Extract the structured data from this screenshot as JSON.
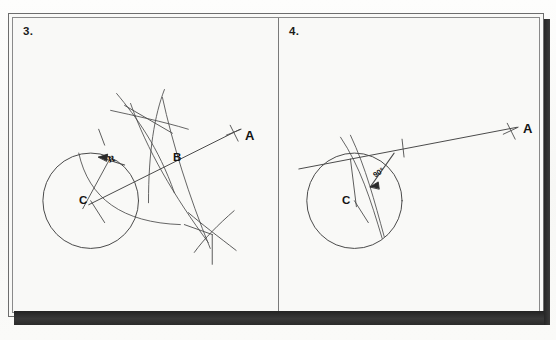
{
  "page": {
    "caption_above": "the circle.",
    "background_color": "#fbfbfa",
    "ink_color": "#3a3a3a",
    "label_color": "#141414"
  },
  "panels": [
    {
      "number": "3.",
      "name": "construction-step-3",
      "labels": {
        "point_a": "A",
        "point_b": "B",
        "center_c": "C",
        "radius": "R"
      },
      "elements": {
        "circle": "circle centered at C",
        "ray": "ray from circle through B to A",
        "arcs": "compass arcs intersecting above and below the ray",
        "radius_arrow": "leader arrow pointing to radius arc labeled R"
      }
    },
    {
      "number": "4.",
      "name": "construction-step-4",
      "labels": {
        "point_a": "A",
        "center_c": "C",
        "angle": "90°"
      },
      "elements": {
        "circle": "circle centered at C",
        "tangent_line": "tangent line touching circle running to A",
        "arc": "compass arc through the circle",
        "angle_arrow": "leader arrow pointing to right angle labeled 90°",
        "tick_mark": "perpendicular tick on tangent line"
      }
    }
  ]
}
